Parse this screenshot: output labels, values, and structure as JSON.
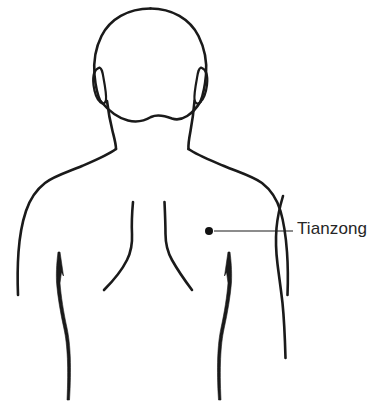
{
  "figure": {
    "view": "posterior upper body",
    "background_color": "#ffffff",
    "line_color": "#1a1a1a"
  },
  "annotations": [
    {
      "label": "Tianzong",
      "marker": "point-dot",
      "point_x": 209,
      "point_y": 231,
      "leader_from_x": 214,
      "leader_to_x": 293,
      "leader_y": 231,
      "text_color": "#262626"
    }
  ]
}
